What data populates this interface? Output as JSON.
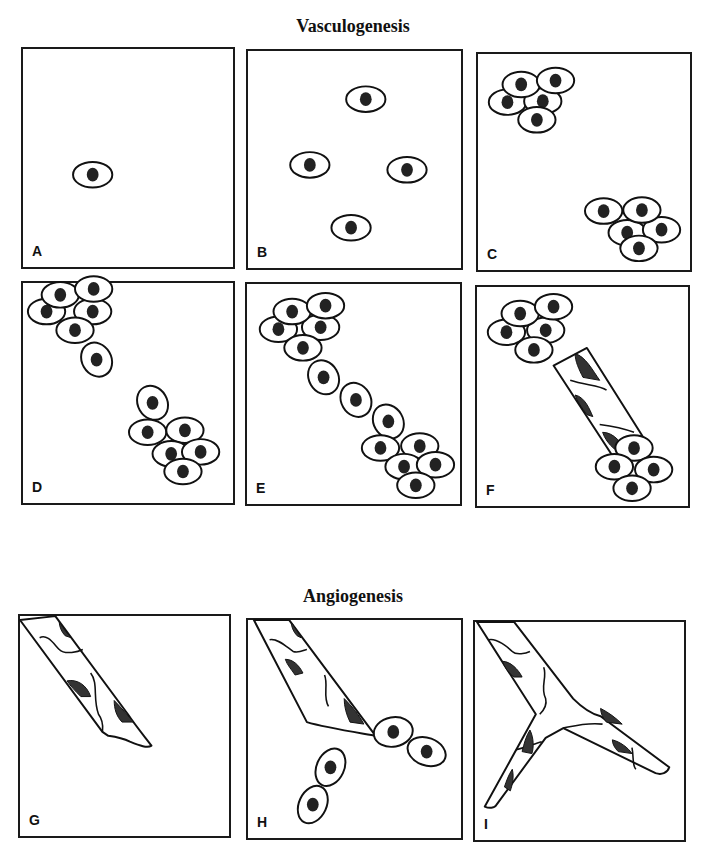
{
  "figure": {
    "sections": [
      {
        "title": "Vasculogenesis",
        "panels": [
          "A",
          "B",
          "C",
          "D",
          "E",
          "F"
        ]
      },
      {
        "title": "Angiogenesis",
        "panels": [
          "G",
          "H",
          "I"
        ]
      }
    ]
  },
  "titles": {
    "vasculogenesis": "Vasculogenesis",
    "angiogenesis": "Angiogenesis"
  },
  "panels": {
    "A": {
      "label": "A",
      "description": "single angioblast"
    },
    "B": {
      "label": "B",
      "description": "four scattered angioblasts"
    },
    "C": {
      "label": "C",
      "description": "two cell clusters"
    },
    "D": {
      "label": "D",
      "description": "clusters extending cells toward each other"
    },
    "E": {
      "label": "E",
      "description": "cells forming a connecting cord"
    },
    "F": {
      "label": "F",
      "description": "lumenized vessel connecting clusters"
    },
    "G": {
      "label": "G",
      "description": "existing vessel"
    },
    "H": {
      "label": "H",
      "description": "vessel sprouting with migrating cells"
    },
    "I": {
      "label": "I",
      "description": "branched vessel"
    }
  },
  "colors": {
    "stroke": "#111111",
    "nucleus": "#222222",
    "background": "#ffffff"
  }
}
